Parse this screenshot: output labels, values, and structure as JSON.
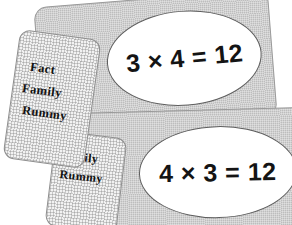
{
  "scene": {
    "background_color": "#ffffff",
    "width": 292,
    "height": 225
  },
  "colors": {
    "card_gray": "#bdbdbd",
    "card_border": "#9a9a9a",
    "label_paper": "#f2f2f2",
    "label_border": "#8e8e8e",
    "oval_fill": "#ffffff",
    "oval_outline": "#5e5e5e",
    "text_color": "#141414"
  },
  "cards": [
    {
      "id": "card-top",
      "equation": "3 × 4 = 12",
      "label_lines": {
        "line1": "Fact",
        "line2": "Family",
        "line3": "Rummy"
      }
    },
    {
      "id": "card-bottom",
      "equation": "4 × 3 = 12",
      "label_lines": {
        "line1": "Fact",
        "line2": "Family",
        "line3": "Rummy"
      }
    }
  ]
}
